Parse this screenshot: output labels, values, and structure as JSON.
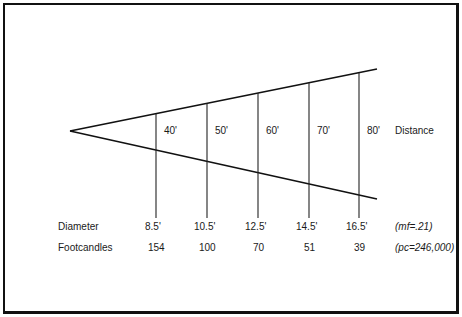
{
  "diagram": {
    "title": "",
    "distance_label": "Distance",
    "diameter_label": "Diameter",
    "footcandles_label": "Footcandles",
    "mf_note": "(mf=.21)",
    "pc_note": "(pc=246,000)",
    "columns": [
      {
        "distance": "40'",
        "diameter": "8.5'",
        "footcandles": "154"
      },
      {
        "distance": "50'",
        "diameter": "10.5'",
        "footcandles": "100"
      },
      {
        "distance": "60'",
        "diameter": "12.5'",
        "footcandles": "70"
      },
      {
        "distance": "70'",
        "diameter": "14.5'",
        "footcandles": "51"
      },
      {
        "distance": "80'",
        "diameter": "16.5'",
        "footcandles": "39"
      }
    ],
    "colors": {
      "line": "#111111",
      "background": "#ffffff"
    }
  }
}
